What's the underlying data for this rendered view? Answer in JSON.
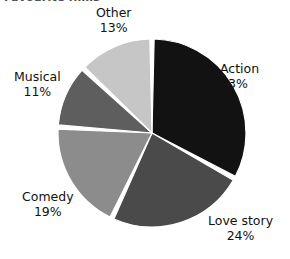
{
  "title": "Favourite films",
  "chart_data": {
    "type": "pie",
    "title": "Favourite films",
    "xlabel": "",
    "ylabel": "",
    "legend_position": "none",
    "grid": false,
    "value_unit": "%",
    "categories": [
      "Action",
      "Love story",
      "Comedy",
      "Musical",
      "Other"
    ],
    "values": [
      33,
      24,
      19,
      11,
      13
    ],
    "labels": [
      "33%",
      "24%",
      "19%",
      "11%",
      "13%"
    ],
    "colors": [
      "#121212",
      "#4a4a4a",
      "#8c8c8c",
      "#5e5e5e",
      "#c6c6c6"
    ],
    "start_angle_deg": 0,
    "direction": "clockwise",
    "slice_gap": true,
    "slices": [
      {
        "name": "Action",
        "value": 33,
        "label": "33%",
        "color": "#121212"
      },
      {
        "name": "Love story",
        "value": 24,
        "label": "24%",
        "color": "#4a4a4a"
      },
      {
        "name": "Comedy",
        "value": 19,
        "label": "19%",
        "color": "#8c8c8c"
      },
      {
        "name": "Musical",
        "value": 11,
        "label": "11%",
        "color": "#5e5e5e"
      },
      {
        "name": "Other",
        "value": 13,
        "label": "13%",
        "color": "#c6c6c6"
      }
    ]
  },
  "labels": {
    "action": {
      "name": "Action",
      "value": "33%"
    },
    "love_story": {
      "name": "Love story",
      "value": "24%"
    },
    "comedy": {
      "name": "Comedy",
      "value": "19%"
    },
    "musical": {
      "name": "Musical",
      "value": "11%"
    },
    "other": {
      "name": "Other",
      "value": "13%"
    }
  }
}
